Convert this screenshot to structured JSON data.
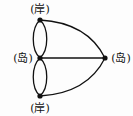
{
  "diagram": {
    "type": "graph",
    "nodes": [
      {
        "id": "top",
        "label": "(岸)"
      },
      {
        "id": "mid",
        "label": "(岛)"
      },
      {
        "id": "bottom",
        "label": "(岸)"
      },
      {
        "id": "right",
        "label": "(岛)"
      }
    ],
    "edges": [
      [
        "top",
        "mid"
      ],
      [
        "top",
        "mid"
      ],
      [
        "mid",
        "bottom"
      ],
      [
        "mid",
        "bottom"
      ],
      [
        "top",
        "right"
      ],
      [
        "mid",
        "right"
      ],
      [
        "bottom",
        "right"
      ]
    ],
    "colors": {
      "line": "#111111",
      "node": "#111111"
    }
  }
}
